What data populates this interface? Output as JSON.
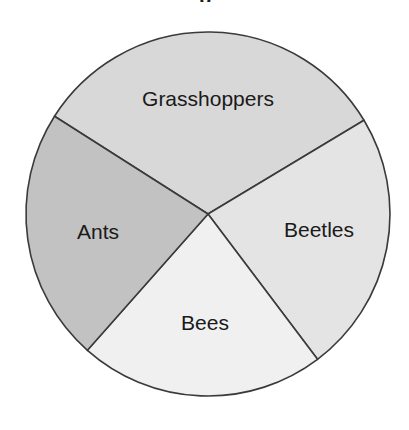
{
  "figure": {
    "background_color": "#ffffff",
    "width": 409,
    "height": 430,
    "title_fragment": "p",
    "title_fragment_note": "top of chart title is cropped off above the image edge"
  },
  "chart_data": {
    "type": "pie",
    "title": "",
    "xlabel": "",
    "ylabel": "",
    "legend": "none",
    "grid": false,
    "labels_position": "inside-slices",
    "categories": [
      "Grasshoppers",
      "Beetles",
      "Bees",
      "Ants"
    ],
    "values": [
      116.5,
      84.0,
      78.5,
      81.0
    ],
    "value_unit": "degrees",
    "percentages": [
      32.4,
      23.3,
      21.8,
      22.5
    ],
    "start_angle_deg": 59,
    "direction": "clockwise",
    "slices": [
      {
        "label": "Grasshoppers",
        "angle_deg": 116.5,
        "percent": 32.4,
        "start_deg": 302.5,
        "end_deg": 59.0,
        "color": "#d8d8d8",
        "label_x": 208,
        "label_y": 100
      },
      {
        "label": "Beetles",
        "angle_deg": 84.0,
        "percent": 23.3,
        "start_deg": 59.0,
        "end_deg": 143.0,
        "color": "#e4e4e4",
        "label_x": 319,
        "label_y": 231
      },
      {
        "label": "Bees",
        "angle_deg": 78.5,
        "percent": 21.8,
        "start_deg": 143.0,
        "end_deg": 221.5,
        "color": "#f0f0f0",
        "label_x": 205,
        "label_y": 324
      },
      {
        "label": "Ants",
        "angle_deg": 81.0,
        "percent": 22.5,
        "start_deg": 221.5,
        "end_deg": 302.5,
        "color": "#c2c2c2",
        "label_x": 98,
        "label_y": 233
      }
    ],
    "geometry": {
      "center_x": 208,
      "center_y": 214,
      "radius": 182,
      "outline_color": "#3a3a3a",
      "outline_width": 1.6
    }
  }
}
